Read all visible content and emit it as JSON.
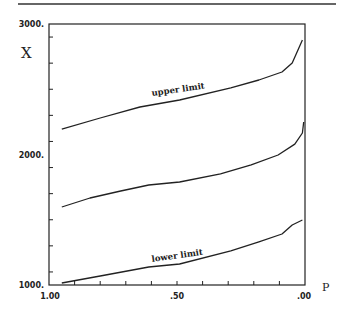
{
  "chart_data": {
    "type": "line",
    "title": "",
    "xlabel": "P",
    "ylabel": "X",
    "xlim": [
      1.0,
      0.0
    ],
    "ylim": [
      1000,
      3000
    ],
    "x_reversed": true,
    "grid": false,
    "legend": null,
    "x_tick_labels": [
      "1.00",
      ".50",
      ".00"
    ],
    "y_tick_labels": [
      "1000.",
      "2000.",
      "3000."
    ],
    "annotations": [
      "upper limit",
      "lower limit"
    ],
    "series": [
      {
        "name": "upper limit",
        "x": [
          0.95,
          0.8,
          0.645,
          0.49,
          0.29,
          0.18,
          0.09,
          0.05,
          0.01
        ],
        "y": [
          2195,
          2280,
          2364,
          2418,
          2510,
          2571,
          2632,
          2701,
          2877
        ]
      },
      {
        "name": "estimate",
        "x": [
          0.95,
          0.84,
          0.72,
          0.61,
          0.49,
          0.33,
          0.21,
          0.105,
          0.04,
          0.01,
          0.005
        ],
        "y": [
          1598,
          1667,
          1720,
          1766,
          1789,
          1851,
          1920,
          1996,
          2080,
          2165,
          2249
        ]
      },
      {
        "name": "lower limit",
        "x": [
          0.95,
          0.8,
          0.61,
          0.49,
          0.29,
          0.18,
          0.09,
          0.05,
          0.01
        ],
        "y": [
          1015,
          1069,
          1138,
          1161,
          1261,
          1330,
          1391,
          1460,
          1498
        ]
      }
    ]
  },
  "labels": {
    "y_axis": "X",
    "x_axis": "P",
    "upper": "upper limit",
    "lower": "lower limit",
    "y_ticks": [
      "3000.",
      "2000.",
      "1000."
    ],
    "x_ticks": [
      "1.00",
      ".50",
      ".00"
    ]
  }
}
